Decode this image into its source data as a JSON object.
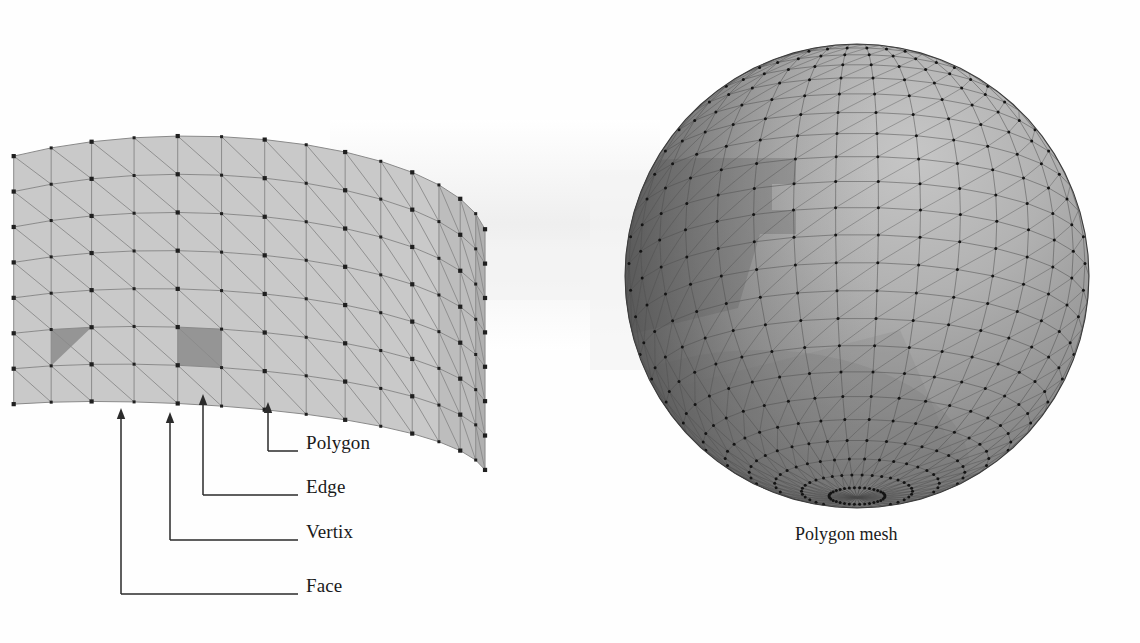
{
  "figure": {
    "background_color": "#fefefe",
    "width": 1140,
    "height": 643
  },
  "palette": {
    "patch_fill": "#c9c9c9",
    "patch_fill_shaded": "#bdbdbd",
    "patch_edge": "#8a8a8a",
    "highlight_fill": "#959595",
    "vertex_dot": "#1f1f1f",
    "sphere_light": "#b4b4b4",
    "sphere_mid": "#9a9a9a",
    "sphere_dark": "#6d6d6d",
    "sphere_shadow": "#7e7e7e",
    "sphere_edge": "#4a4a4a",
    "leader_line": "#2b2b2b",
    "label_text": "#1a1a1a",
    "backdrop_shadow": "#efefef"
  },
  "left_panel": {
    "name": "mesh-patch",
    "description": "Curved triangulated quadrilateral mesh patch",
    "annotations": [
      {
        "id": "face",
        "label": "Face",
        "target_x": 121,
        "target_y": 410,
        "elbow_y": 594,
        "label_x": 306,
        "label_y": 586
      },
      {
        "id": "vertix",
        "label": "Vertix",
        "target_x": 170,
        "target_y": 414,
        "elbow_y": 540,
        "label_x": 306,
        "label_y": 532
      },
      {
        "id": "edge",
        "label": "Edge",
        "target_x": 203,
        "target_y": 396,
        "elbow_y": 495,
        "label_x": 306,
        "label_y": 487
      },
      {
        "id": "polygon",
        "label": "Polygon",
        "target_x": 268,
        "target_y": 404,
        "elbow_y": 451,
        "label_x": 306,
        "label_y": 443
      }
    ]
  },
  "right_panel": {
    "name": "polygon-mesh-sphere",
    "caption": "Polygon mesh",
    "caption_x": 795,
    "caption_y": 535,
    "sphere": {
      "center_x": 857,
      "center_y": 276,
      "radius": 232,
      "meridians": 34,
      "parallels": 26
    }
  }
}
